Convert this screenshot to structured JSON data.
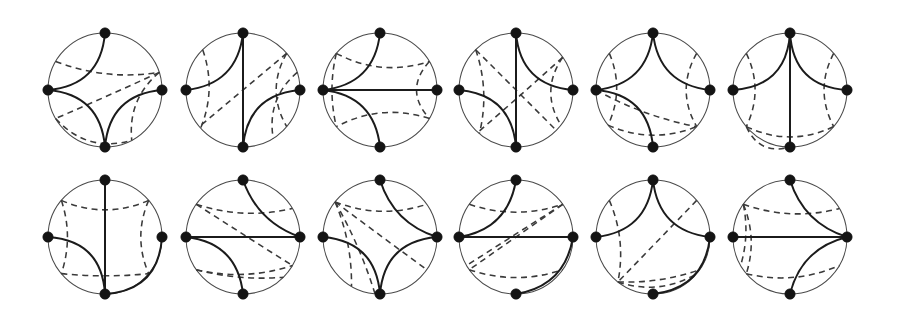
{
  "figure": {
    "width": 898,
    "height": 314,
    "background_color": "#ffffff",
    "rows": 2,
    "columns": 6,
    "panel_count": 12,
    "style": {
      "boundary_color": "#4a4a4a",
      "boundary_width": 1.05,
      "solid_arc_color": "#1b1b1b",
      "solid_arc_width": 2.0,
      "dashed_arc_color": "#3a3a3a",
      "dashed_arc_width": 1.55,
      "dash_pattern": "6 4.5",
      "vertex_color": "#141414",
      "vertex_radius": 5.2
    },
    "geometry": {
      "radius": 57,
      "row_centers_y": [
        90,
        237
      ],
      "column_centers_x": [
        105,
        243,
        380,
        516,
        653,
        790
      ]
    },
    "vertex_angles_deg": {
      "top": -90,
      "left": 180,
      "right": 0,
      "bottom": 90
    }
  },
  "panels": [
    {
      "index": 1,
      "name": "panel-r1c1",
      "row": 1,
      "column": 1,
      "cx": 105,
      "cy": 90,
      "r": 57,
      "vertices": [
        {
          "name": "top",
          "angle": -90
        },
        {
          "name": "left",
          "angle": 180
        },
        {
          "name": "right",
          "angle": 0
        },
        {
          "name": "bottom",
          "angle": 90
        }
      ],
      "solid_arcs": [
        {
          "from": -90,
          "to": 180,
          "bulge": 0.42
        },
        {
          "from": 180,
          "to": 90,
          "bulge": 0.42
        },
        {
          "from": 90,
          "to": 0,
          "bulge": 0.42
        }
      ],
      "dashed_arcs": [
        {
          "from": -150,
          "to": -18,
          "bulge": 0.3
        },
        {
          "from": -18,
          "to": 150,
          "bulge": -0.06
        },
        {
          "from": -18,
          "to": 62,
          "bulge": 0.22
        },
        {
          "from": 150,
          "to": 62,
          "bulge": -0.3
        }
      ]
    },
    {
      "index": 2,
      "name": "panel-r1c2",
      "row": 1,
      "column": 2,
      "cx": 243,
      "cy": 90,
      "r": 57,
      "vertices": [
        {
          "name": "top",
          "angle": -90
        },
        {
          "name": "left",
          "angle": 180
        },
        {
          "name": "right",
          "angle": 0
        },
        {
          "name": "bottom",
          "angle": 90
        }
      ],
      "solid_arcs": [
        {
          "from": -90,
          "to": 180,
          "bulge": 0.4
        },
        {
          "from": -90,
          "to": 90,
          "bulge": 0.1
        },
        {
          "from": 90,
          "to": 0,
          "bulge": 0.42
        }
      ],
      "dashed_arcs": [
        {
          "from": -135,
          "to": 138,
          "bulge": 0.18
        },
        {
          "from": -40,
          "to": 140,
          "bulge": 0.02
        },
        {
          "from": -40,
          "to": 40,
          "bulge": 0.24
        },
        {
          "from": -18,
          "to": 58,
          "bulge": 0.22
        }
      ]
    },
    {
      "index": 3,
      "name": "panel-r1c3",
      "row": 1,
      "column": 3,
      "cx": 380,
      "cy": 90,
      "r": 57,
      "vertices": [
        {
          "name": "top",
          "angle": -90
        },
        {
          "name": "left",
          "angle": 180
        },
        {
          "name": "right",
          "angle": 0
        },
        {
          "name": "bottom",
          "angle": 90
        }
      ],
      "solid_arcs": [
        {
          "from": -90,
          "to": 180,
          "bulge": 0.4
        },
        {
          "from": 180,
          "to": 0,
          "bulge": 0.02
        },
        {
          "from": 180,
          "to": 90,
          "bulge": 0.4
        }
      ],
      "dashed_arcs": [
        {
          "from": -140,
          "to": -30,
          "bulge": 0.3
        },
        {
          "from": -30,
          "to": 30,
          "bulge": 0.26
        },
        {
          "from": 30,
          "to": 140,
          "bulge": 0.3
        },
        {
          "from": -140,
          "to": 140,
          "bulge": -0.1
        }
      ]
    },
    {
      "index": 4,
      "name": "panel-r1c4",
      "row": 1,
      "column": 4,
      "cx": 516,
      "cy": 90,
      "r": 57,
      "vertices": [
        {
          "name": "top",
          "angle": -90
        },
        {
          "name": "left",
          "angle": 180
        },
        {
          "name": "right",
          "angle": 0
        },
        {
          "name": "bottom",
          "angle": 90
        }
      ],
      "solid_arcs": [
        {
          "from": -90,
          "to": 0,
          "bulge": 0.42
        },
        {
          "from": -90,
          "to": 90,
          "bulge": 0.0
        },
        {
          "from": 180,
          "to": 90,
          "bulge": 0.42
        }
      ],
      "dashed_arcs": [
        {
          "from": -135,
          "to": 130,
          "bulge": 0.16
        },
        {
          "from": -135,
          "to": 45,
          "bulge": 0.06
        },
        {
          "from": -35,
          "to": 38,
          "bulge": 0.24
        },
        {
          "from": -35,
          "to": 132,
          "bulge": -0.05
        }
      ]
    },
    {
      "index": 5,
      "name": "panel-r1c5",
      "row": 1,
      "column": 5,
      "cx": 653,
      "cy": 90,
      "r": 57,
      "vertices": [
        {
          "name": "top",
          "angle": -90
        },
        {
          "name": "left",
          "angle": 180
        },
        {
          "name": "right",
          "angle": 0
        },
        {
          "name": "bottom",
          "angle": 90
        }
      ],
      "solid_arcs": [
        {
          "from": -90,
          "to": 180,
          "bulge": 0.4
        },
        {
          "from": -90,
          "to": 0,
          "bulge": 0.4
        },
        {
          "from": 180,
          "to": 90,
          "bulge": 0.42
        }
      ],
      "dashed_arcs": [
        {
          "from": -140,
          "to": 142,
          "bulge": 0.18
        },
        {
          "from": -40,
          "to": 40,
          "bulge": 0.24
        },
        {
          "from": 180,
          "to": 40,
          "bulge": -0.22
        },
        {
          "from": 142,
          "to": 40,
          "bulge": -0.26
        }
      ]
    },
    {
      "index": 6,
      "name": "panel-r1c6",
      "row": 1,
      "column": 6,
      "cx": 790,
      "cy": 90,
      "r": 57,
      "vertices": [
        {
          "name": "top",
          "angle": -90
        },
        {
          "name": "left",
          "angle": 180
        },
        {
          "name": "right",
          "angle": 0
        },
        {
          "name": "bottom",
          "angle": 90
        }
      ],
      "solid_arcs": [
        {
          "from": -90,
          "to": 180,
          "bulge": 0.44
        },
        {
          "from": -90,
          "to": 0,
          "bulge": 0.44
        },
        {
          "from": -90,
          "to": 90,
          "bulge": 0.02
        }
      ],
      "dashed_arcs": [
        {
          "from": -140,
          "to": 140,
          "bulge": 0.2
        },
        {
          "from": -40,
          "to": 40,
          "bulge": 0.22
        },
        {
          "from": 140,
          "to": 40,
          "bulge": -0.28
        },
        {
          "from": 140,
          "to": 90,
          "bulge": -0.2
        }
      ]
    },
    {
      "index": 7,
      "name": "panel-r2c1",
      "row": 2,
      "column": 1,
      "cx": 105,
      "cy": 237,
      "r": 57,
      "vertices": [
        {
          "name": "top",
          "angle": -90
        },
        {
          "name": "left",
          "angle": 180
        },
        {
          "name": "right",
          "angle": 0
        },
        {
          "name": "bottom",
          "angle": 90
        }
      ],
      "solid_arcs": [
        {
          "from": -90,
          "to": 90,
          "bulge": 0.0
        },
        {
          "from": 180,
          "to": 90,
          "bulge": 0.44
        },
        {
          "from": 0,
          "to": 90,
          "bulge": -0.44
        }
      ],
      "dashed_arcs": [
        {
          "from": -140,
          "to": -40,
          "bulge": 0.26
        },
        {
          "from": -140,
          "to": 140,
          "bulge": 0.14
        },
        {
          "from": -40,
          "to": 40,
          "bulge": 0.18
        },
        {
          "from": 140,
          "to": 40,
          "bulge": -0.06
        }
      ]
    },
    {
      "index": 8,
      "name": "panel-r2c2",
      "row": 2,
      "column": 2,
      "cx": 243,
      "cy": 237,
      "r": 57,
      "vertices": [
        {
          "name": "top",
          "angle": -90
        },
        {
          "name": "left",
          "angle": 180
        },
        {
          "name": "right",
          "angle": 0
        },
        {
          "name": "bottom",
          "angle": 90
        }
      ],
      "solid_arcs": [
        {
          "from": -90,
          "to": 0,
          "bulge": 0.24
        },
        {
          "from": 180,
          "to": 0,
          "bulge": 0.0
        },
        {
          "from": 180,
          "to": 90,
          "bulge": 0.4
        }
      ],
      "dashed_arcs": [
        {
          "from": -145,
          "to": -30,
          "bulge": 0.22
        },
        {
          "from": -145,
          "to": 30,
          "bulge": 0.06
        },
        {
          "from": 145,
          "to": 30,
          "bulge": -0.22
        },
        {
          "from": 145,
          "to": 45,
          "bulge": -0.1
        }
      ]
    },
    {
      "index": 9,
      "name": "panel-r2c3",
      "row": 2,
      "column": 3,
      "cx": 380,
      "cy": 237,
      "r": 57,
      "vertices": [
        {
          "name": "top",
          "angle": -90
        },
        {
          "name": "left",
          "angle": 180
        },
        {
          "name": "right",
          "angle": 0
        },
        {
          "name": "bottom",
          "angle": 90
        }
      ],
      "solid_arcs": [
        {
          "from": -90,
          "to": 0,
          "bulge": 0.26
        },
        {
          "from": 180,
          "to": 90,
          "bulge": 0.42
        },
        {
          "from": 90,
          "to": 0,
          "bulge": 0.42
        }
      ],
      "dashed_arcs": [
        {
          "from": -142,
          "to": -35,
          "bulge": 0.24
        },
        {
          "from": -142,
          "to": 35,
          "bulge": 0.06
        },
        {
          "from": -142,
          "to": 120,
          "bulge": 0.12
        },
        {
          "from": -142,
          "to": 95,
          "bulge": 0.1
        }
      ]
    },
    {
      "index": 10,
      "name": "panel-r2c4",
      "row": 2,
      "column": 4,
      "cx": 516,
      "cy": 237,
      "r": 57,
      "vertices": [
        {
          "name": "top",
          "angle": -90
        },
        {
          "name": "left",
          "angle": 180
        },
        {
          "name": "right",
          "angle": 0
        },
        {
          "name": "bottom",
          "angle": 90
        }
      ],
      "solid_arcs": [
        {
          "from": -90,
          "to": 180,
          "bulge": 0.36
        },
        {
          "from": 180,
          "to": 0,
          "bulge": 0.0
        },
        {
          "from": 0,
          "to": 90,
          "bulge": -0.36
        }
      ],
      "dashed_arcs": [
        {
          "from": -145,
          "to": -35,
          "bulge": 0.24
        },
        {
          "from": -35,
          "to": 145,
          "bulge": 0.0
        },
        {
          "from": 145,
          "to": 35,
          "bulge": -0.24
        },
        {
          "from": -35,
          "to": 150,
          "bulge": -0.04
        }
      ]
    },
    {
      "index": 11,
      "name": "panel-r2c5",
      "row": 2,
      "column": 5,
      "cx": 653,
      "cy": 237,
      "r": 57,
      "vertices": [
        {
          "name": "top",
          "angle": -90
        },
        {
          "name": "left",
          "angle": 180
        },
        {
          "name": "right",
          "angle": 0
        },
        {
          "name": "bottom",
          "angle": 90
        }
      ],
      "solid_arcs": [
        {
          "from": -90,
          "to": 180,
          "bulge": 0.4
        },
        {
          "from": -90,
          "to": 0,
          "bulge": 0.4
        },
        {
          "from": 0,
          "to": 90,
          "bulge": -0.4
        }
      ],
      "dashed_arcs": [
        {
          "from": -140,
          "to": 128,
          "bulge": 0.16
        },
        {
          "from": -40,
          "to": 128,
          "bulge": -0.02
        },
        {
          "from": 128,
          "to": 40,
          "bulge": -0.22
        },
        {
          "from": 128,
          "to": 35,
          "bulge": -0.1
        }
      ]
    },
    {
      "index": 12,
      "name": "panel-r2c6",
      "row": 2,
      "column": 6,
      "cx": 790,
      "cy": 237,
      "r": 57,
      "vertices": [
        {
          "name": "top",
          "angle": -90
        },
        {
          "name": "left",
          "angle": 180
        },
        {
          "name": "right",
          "angle": 0
        },
        {
          "name": "bottom",
          "angle": 90
        }
      ],
      "solid_arcs": [
        {
          "from": -90,
          "to": 0,
          "bulge": 0.26
        },
        {
          "from": 180,
          "to": 0,
          "bulge": 0.0
        },
        {
          "from": 90,
          "to": 0,
          "bulge": 0.3
        }
      ],
      "dashed_arcs": [
        {
          "from": -145,
          "to": -30,
          "bulge": 0.24
        },
        {
          "from": -145,
          "to": 140,
          "bulge": 0.14
        },
        {
          "from": 140,
          "to": 30,
          "bulge": -0.24
        },
        {
          "from": -145,
          "to": 150,
          "bulge": 0.08
        }
      ]
    }
  ]
}
